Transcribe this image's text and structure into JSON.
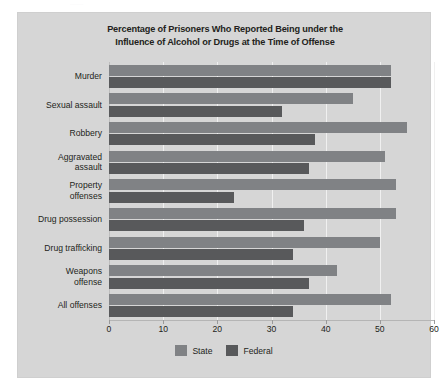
{
  "top_artifact_text": "........",
  "chart_data": {
    "type": "bar",
    "orientation": "horizontal",
    "title": "Percentage of Prisoners Who Reported Being under the Influence of Alcohol or Drugs at the Time of Offense",
    "title_line1": "Percentage of Prisoners Who Reported Being under the",
    "title_line2": "Influence of Alcohol or Drugs at the Time of Offense",
    "xlabel": "",
    "ylabel": "",
    "xlim": [
      0,
      60
    ],
    "xticks": [
      0,
      10,
      20,
      30,
      40,
      50,
      60
    ],
    "xtick_labels": [
      "0",
      "10",
      "20",
      "30",
      "40",
      "50",
      "60"
    ],
    "grid": true,
    "legend_position": "bottom-center",
    "categories": [
      "Murder",
      "Sexual assault",
      "Robbery",
      "Aggravated assault",
      "Property offenses",
      "Drug possession",
      "Drug trafficking",
      "Weapons offense",
      "All offenses"
    ],
    "category_lines": [
      [
        "Murder"
      ],
      [
        "Sexual assault"
      ],
      [
        "Robbery"
      ],
      [
        "Aggravated",
        "assault"
      ],
      [
        "Property",
        "offenses"
      ],
      [
        "Drug possession"
      ],
      [
        "Drug trafficking"
      ],
      [
        "Weapons",
        "offense"
      ],
      [
        "All offenses"
      ]
    ],
    "series": [
      {
        "name": "State",
        "color": "#808285",
        "values": [
          52,
          45,
          55,
          51,
          53,
          53,
          50,
          42,
          52
        ]
      },
      {
        "name": "Federal",
        "color": "#58595b",
        "values": [
          52,
          32,
          38,
          37,
          23,
          36,
          34,
          37,
          34
        ]
      }
    ]
  },
  "legend": {
    "items": [
      {
        "label": "State",
        "color": "#808285"
      },
      {
        "label": "Federal",
        "color": "#58595b"
      }
    ]
  }
}
